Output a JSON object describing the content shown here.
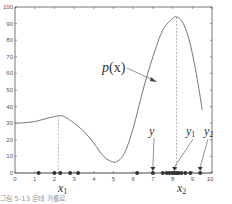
{
  "chart_data": {
    "type": "line",
    "title": "",
    "xlabel": "",
    "ylabel": "",
    "xlim": [
      0,
      10
    ],
    "ylim": [
      0,
      100
    ],
    "grid": false,
    "x_ticks": [
      0,
      1,
      2,
      3,
      4,
      5,
      6,
      7,
      8,
      9,
      10
    ],
    "y_ticks": [
      0,
      10,
      20,
      30,
      40,
      50,
      60,
      70,
      80,
      90,
      100
    ],
    "series": [
      {
        "name": "p(x)",
        "x": [
          0,
          0.5,
          1,
          1.5,
          2,
          2.2,
          2.5,
          3,
          3.5,
          4,
          4.5,
          5,
          5.3,
          5.6,
          6,
          6.5,
          7,
          7.5,
          8,
          8.2,
          8.5,
          8.8,
          9,
          9.2,
          9.4,
          9.5
        ],
        "values": [
          30,
          30.3,
          31,
          32.5,
          34,
          34.5,
          34,
          30,
          25,
          18,
          10,
          6.5,
          8,
          13,
          27,
          50,
          70,
          86,
          93,
          94,
          91,
          82,
          72,
          60,
          46,
          38
        ]
      }
    ],
    "samples": {
      "x": [
        1.2,
        2.0,
        2.3,
        2.8,
        3.2,
        6.2,
        7.0,
        7.5,
        7.7,
        7.85,
        8.0,
        8.1,
        8.2,
        8.3,
        8.45,
        8.65,
        8.9,
        9.4
      ],
      "y": 0
    },
    "markers": [
      {
        "label": "y",
        "x": 7.0
      },
      {
        "label": "y1",
        "x": 8.1
      },
      {
        "label": "y2",
        "x": 9.4
      }
    ],
    "dashed_lines": [
      {
        "label": "x1",
        "x": 2.2,
        "y_top": 34.5
      },
      {
        "label": "x2",
        "x": 8.2,
        "y_top": 94
      }
    ],
    "annotations": [
      {
        "text": "p(x)",
        "points_to_x": 7.0,
        "points_to_y": 70
      },
      {
        "text": "x1",
        "at_x": 2.2
      },
      {
        "text": "x2",
        "at_x": 8.2
      },
      {
        "text": "y",
        "points_to_x": 7.0
      },
      {
        "text": "y1",
        "points_to_x": 8.1
      },
      {
        "text": "y2",
        "points_to_x": 9.4
      }
    ]
  },
  "labels": {
    "curve": "p",
    "curve_arg": "(x)",
    "x1_base": "x",
    "x1_sub": "1",
    "x2_base": "x",
    "x2_sub": "2",
    "y": "y",
    "y1_base": "y",
    "y1_sub": "1",
    "y2_base": "y",
    "y2_sub": "2"
  },
  "axis": {
    "x_ticks": [
      "0",
      "1",
      "2",
      "3",
      "4",
      "5",
      "6",
      "7",
      "8",
      "9",
      "10"
    ],
    "y_ticks": [
      "0",
      "10",
      "20",
      "30",
      "40",
      "50",
      "60",
      "70",
      "80",
      "90",
      "100"
    ]
  },
  "caption": "그림 5-13 몬테 카를로"
}
